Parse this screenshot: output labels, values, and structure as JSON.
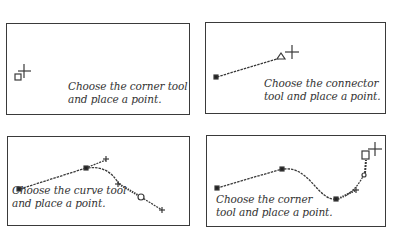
{
  "panels": [
    {
      "id": "corner-start",
      "caption_line1": "Choose the corner tool",
      "caption_line2": "and place a point."
    },
    {
      "id": "connector",
      "caption_line1": "Choose the connector",
      "caption_line2": "tool and place a point."
    },
    {
      "id": "curve",
      "caption_line1": "Choose the curve tool",
      "caption_line2": "and place a point."
    },
    {
      "id": "corner-end",
      "caption_line1": "Choose the corner",
      "caption_line2": "tool and place a point."
    }
  ],
  "icons": {
    "corner_point": "small-square",
    "connector_point": "small-triangle",
    "curve_point": "small-circle",
    "cursor": "crosshair"
  },
  "colors": {
    "stroke": "#3a3a3a",
    "text": "#333333",
    "background": "#ffffff"
  }
}
